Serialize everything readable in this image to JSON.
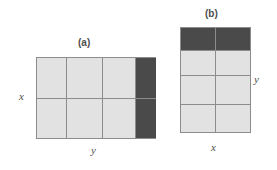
{
  "figure": {
    "background_color": "#ffffff",
    "cell_color": "#e2e2e2",
    "highlight_color": "#4a4a4a",
    "line_color": "#8c8c8c",
    "text_color": "#4d4d4d"
  },
  "panel_a": {
    "label": "(a)",
    "axis_left_label": "x",
    "axis_bottom_label": "y",
    "columns": 4,
    "rows": 2,
    "cells": [
      {
        "id": "a-r1c1",
        "state": "normal"
      },
      {
        "id": "a-r1c2",
        "state": "normal"
      },
      {
        "id": "a-r1c3",
        "state": "normal"
      },
      {
        "id": "a-r1c4",
        "state": "highlighted"
      },
      {
        "id": "a-r2c1",
        "state": "normal"
      },
      {
        "id": "a-r2c2",
        "state": "normal"
      },
      {
        "id": "a-r2c3",
        "state": "normal"
      },
      {
        "id": "a-r2c4",
        "state": "highlighted"
      }
    ]
  },
  "panel_b": {
    "label": "(b)",
    "axis_right_label": "y",
    "axis_bottom_label": "x",
    "columns": 2,
    "rows": 4,
    "cells": [
      {
        "id": "b-r1c1",
        "state": "highlighted"
      },
      {
        "id": "b-r1c2",
        "state": "highlighted"
      },
      {
        "id": "b-r2c1",
        "state": "normal"
      },
      {
        "id": "b-r2c2",
        "state": "normal"
      },
      {
        "id": "b-r3c1",
        "state": "normal"
      },
      {
        "id": "b-r3c2",
        "state": "normal"
      },
      {
        "id": "b-r4c1",
        "state": "normal"
      },
      {
        "id": "b-r4c2",
        "state": "normal"
      }
    ]
  }
}
